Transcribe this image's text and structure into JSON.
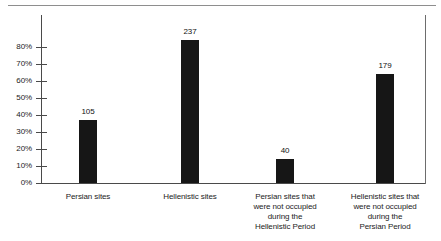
{
  "chart_data": {
    "type": "bar",
    "title": "",
    "subtitle": "",
    "xlabel": "",
    "ylabel": "",
    "categories": [
      "Persian sites",
      "Hellenistic sites",
      "Persian sites that were not occupied during the Hellenistic Period",
      "Hellenistic sites that were not occupied during the Persian Period"
    ],
    "category_lines": [
      [
        "Persian sites"
      ],
      [
        "Hellenistic sites"
      ],
      [
        "Persian sites that",
        "were not occupied",
        "during the",
        "Hellenistic Period"
      ],
      [
        "Hellenistic sites that",
        "were not occupied",
        "during the",
        "Persian Period"
      ]
    ],
    "values": [
      37,
      84,
      14,
      64
    ],
    "value_labels": [
      "105",
      "237",
      "40",
      "179"
    ],
    "counts": [
      105,
      237,
      40,
      179
    ],
    "ylim": [
      0,
      90
    ],
    "ytick_values": [
      0,
      10,
      20,
      30,
      40,
      50,
      60,
      70,
      80
    ],
    "ytick_labels": [
      "0%",
      "10%",
      "20%",
      "30%",
      "40%",
      "50%",
      "60%",
      "70%",
      "80%"
    ],
    "grid": false,
    "legend": null,
    "bar_color": "#161616",
    "axis_color": "#4a4a4a"
  }
}
